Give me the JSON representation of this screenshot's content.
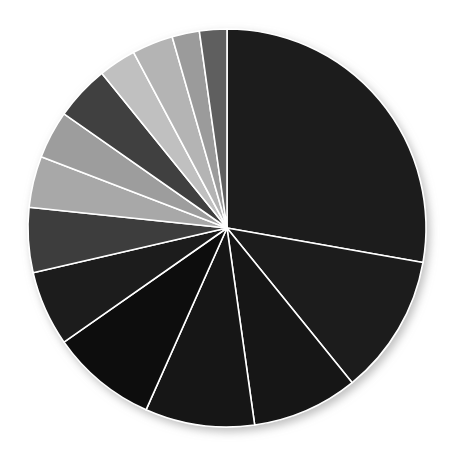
{
  "page": {
    "background_color": "#ffffff",
    "width": 452,
    "height": 450
  },
  "header": {
    "faint_text_left": "",
    "faint_text_right": ""
  },
  "chart_data": {
    "type": "pie",
    "title": "",
    "subtitle": "",
    "xlabel": "",
    "ylabel": "",
    "legend_position": "none",
    "grid": false,
    "start_angle_deg": 0,
    "direction": "clockwise",
    "center": {
      "x": 227,
      "y": 228
    },
    "radius": 199,
    "slice_stroke_color": "#ffffff",
    "slice_stroke_width": 1.6,
    "shadow": {
      "enabled": true,
      "color": "#bfbfbf",
      "offset_x": 3,
      "offset_y": 4,
      "blur": 6
    },
    "total": 100,
    "labels": [
      "Slice 1",
      "Slice 2",
      "Slice 3",
      "Slice 4",
      "Slice 5",
      "Slice 6",
      "Slice 7",
      "Slice 8",
      "Slice 9",
      "Slice 10",
      "Slice 11",
      "Slice 12",
      "Slice 13",
      "Slice 14"
    ],
    "values": [
      27.8,
      11.4,
      8.6,
      8.9,
      8.6,
      6.1,
      5.3,
      4.2,
      3.9,
      4.4,
      3.1,
      3.3,
      2.2,
      2.2
    ],
    "colors": [
      "#1d1d1d",
      "#1d1d1d",
      "#141414",
      "#141414",
      "#111111",
      "#1a1a1a",
      "#3c3c3c",
      "#a8a8a8",
      "#9d9d9d",
      "#3f3f3f",
      "#c0c0c0",
      "#b4b4b4",
      "#9b9b9b",
      "#5e5e5e"
    ],
    "slices": [
      {
        "label": "Slice 1",
        "value": 27.8,
        "start_deg": 0.0,
        "end_deg": 100.0,
        "color": "#1d1d1d"
      },
      {
        "label": "Slice 2",
        "value": 11.4,
        "start_deg": 100.0,
        "end_deg": 141.0,
        "color": "#1d1d1d"
      },
      {
        "label": "Slice 3",
        "value": 8.6,
        "start_deg": 141.0,
        "end_deg": 172.0,
        "color": "#141414"
      },
      {
        "label": "Slice 4",
        "value": 8.9,
        "start_deg": 172.0,
        "end_deg": 204.0,
        "color": "#141414"
      },
      {
        "label": "Slice 5",
        "value": 8.6,
        "start_deg": 204.0,
        "end_deg": 235.0,
        "color": "#111111"
      },
      {
        "label": "Slice 6",
        "value": 6.1,
        "start_deg": 235.0,
        "end_deg": 257.0,
        "color": "#1a1a1a"
      },
      {
        "label": "Slice 7",
        "value": 5.3,
        "start_deg": 257.0,
        "end_deg": 276.0,
        "color": "#3c3c3c"
      },
      {
        "label": "Slice 8",
        "value": 4.2,
        "start_deg": 276.0,
        "end_deg": 291.0,
        "color": "#a8a8a8"
      },
      {
        "label": "Slice 9",
        "value": 3.9,
        "start_deg": 291.0,
        "end_deg": 305.0,
        "color": "#9d9d9d"
      },
      {
        "label": "Slice 10",
        "value": 4.4,
        "start_deg": 305.0,
        "end_deg": 321.0,
        "color": "#3f3f3f"
      },
      {
        "label": "Slice 11",
        "value": 3.1,
        "start_deg": 321.0,
        "end_deg": 332.0,
        "color": "#c0c0c0"
      },
      {
        "label": "Slice 12",
        "value": 3.3,
        "start_deg": 332.0,
        "end_deg": 344.0,
        "color": "#b4b4b4"
      },
      {
        "label": "Slice 13",
        "value": 2.2,
        "start_deg": 344.0,
        "end_deg": 352.0,
        "color": "#9b9b9b"
      },
      {
        "label": "Slice 14",
        "value": 2.2,
        "start_deg": 352.0,
        "end_deg": 360.0,
        "color": "#5e5e5e"
      }
    ]
  }
}
